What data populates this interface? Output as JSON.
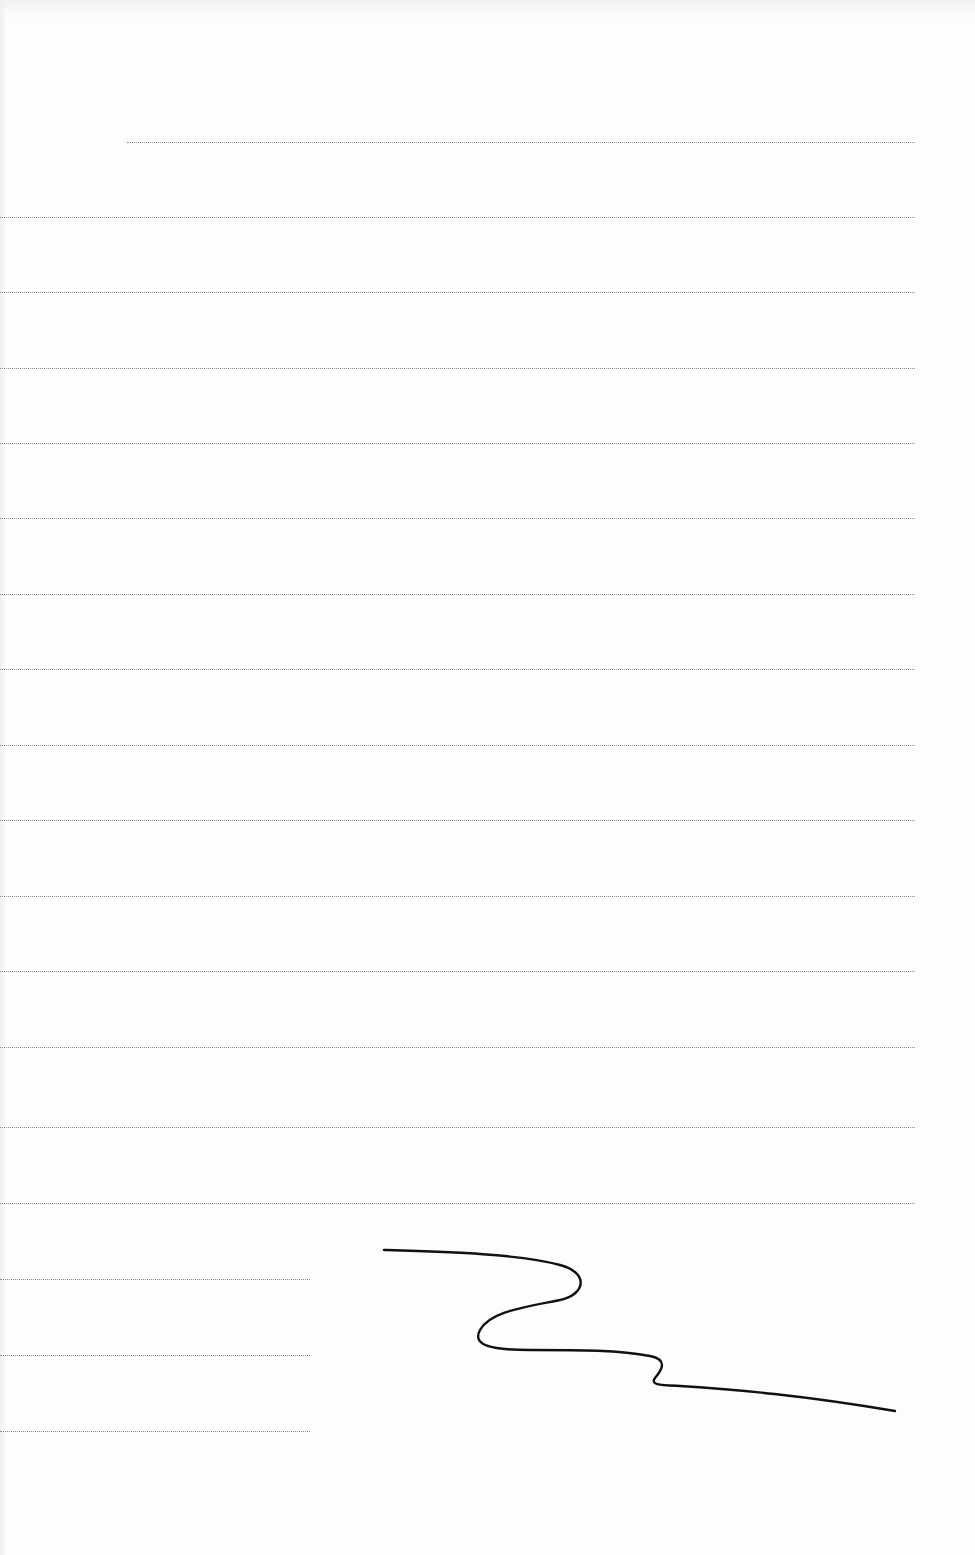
{
  "document": {
    "type": "lined-blank-form",
    "text_content": "",
    "background_color": "#fdfdfd",
    "rule_color": "#8a8a8a",
    "ink_color": "#111111",
    "header_rule": {
      "y": 142,
      "x_start": 127,
      "x_end": 915
    },
    "body_rules": [
      {
        "y": 217,
        "x_start": 0,
        "x_end": 915
      },
      {
        "y": 292,
        "x_start": 0,
        "x_end": 915
      },
      {
        "y": 368,
        "x_start": 0,
        "x_end": 915
      },
      {
        "y": 443,
        "x_start": 0,
        "x_end": 915
      },
      {
        "y": 518,
        "x_start": 0,
        "x_end": 915
      },
      {
        "y": 594,
        "x_start": 0,
        "x_end": 915
      },
      {
        "y": 669,
        "x_start": 0,
        "x_end": 915
      },
      {
        "y": 745,
        "x_start": 0,
        "x_end": 915
      },
      {
        "y": 820,
        "x_start": 0,
        "x_end": 915
      },
      {
        "y": 896,
        "x_start": 0,
        "x_end": 915
      },
      {
        "y": 971,
        "x_start": 0,
        "x_end": 915
      },
      {
        "y": 1047,
        "x_start": 0,
        "x_end": 915
      },
      {
        "y": 1127,
        "x_start": 0,
        "x_end": 915
      },
      {
        "y": 1203,
        "x_start": 0,
        "x_end": 915
      }
    ],
    "short_rules": [
      {
        "y": 1279,
        "x_start": 0,
        "x_end": 310
      },
      {
        "y": 1355,
        "x_start": 0,
        "x_end": 310
      },
      {
        "y": 1431,
        "x_start": 0,
        "x_end": 310
      }
    ],
    "signature": {
      "description": "handwritten wavy signature stroke",
      "path": "M384,1250 C450,1252 520,1254 560,1265 C590,1273 585,1295 560,1300 C520,1308 490,1312 480,1330 C472,1345 490,1350 530,1350 C580,1350 620,1350 650,1356 C670,1360 660,1372 655,1378 C650,1385 660,1385 680,1386 C740,1390 800,1395 895,1411"
    }
  }
}
